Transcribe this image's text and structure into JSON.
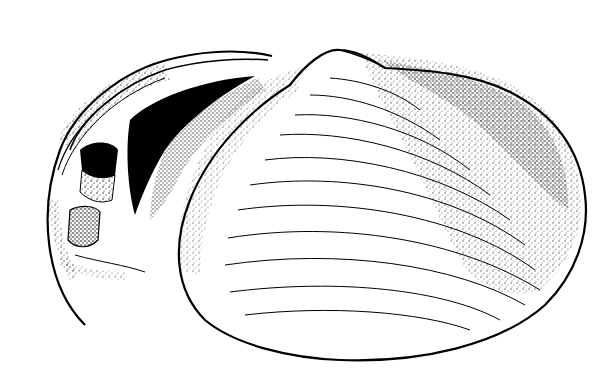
{
  "illustration": {
    "subject": "bivalve-shell",
    "style": "pen-and-ink stipple",
    "colors": {
      "background": "#ffffff",
      "ink": "#000000"
    },
    "parts": [
      {
        "name": "left-valve-interior",
        "description": "opened left valve showing hinge teeth and inner cavity"
      },
      {
        "name": "right-valve-exterior",
        "description": "right valve exterior with umbo and concentric growth lines"
      }
    ]
  }
}
